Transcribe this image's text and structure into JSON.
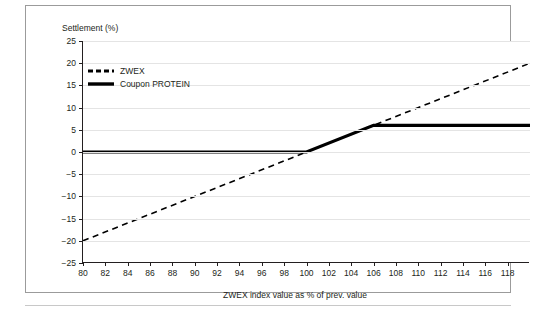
{
  "axis_titles": {
    "y": "Settlement (%)",
    "x": "ZWEX index value as % of prev. value"
  },
  "legend": {
    "items": [
      {
        "label": "ZWEX",
        "style": "dashed",
        "color": "#000000"
      },
      {
        "label": "Coupon PROTEIN",
        "style": "solid",
        "color": "#000000"
      }
    ]
  },
  "chart_data": {
    "type": "line",
    "title": "",
    "subtitle": "",
    "xlabel": "ZWEX index value as % of prev. value",
    "ylabel": "Settlement (%)",
    "xlim": [
      80,
      120
    ],
    "ylim": [
      -25,
      25
    ],
    "xticks": [
      80,
      82,
      84,
      86,
      88,
      90,
      92,
      94,
      96,
      98,
      100,
      102,
      104,
      106,
      108,
      110,
      112,
      114,
      116,
      118
    ],
    "yticks": [
      -25,
      -20,
      -15,
      -10,
      -5,
      0,
      5,
      10,
      15,
      20,
      25
    ],
    "xtick_labels": [
      "80",
      "82",
      "84",
      "86",
      "88",
      "90",
      "92",
      "94",
      "96",
      "98",
      "100",
      "102",
      "104",
      "106",
      "108",
      "110",
      "112",
      "114",
      "116",
      "118"
    ],
    "ytick_labels": [
      "25",
      "20",
      "15",
      "10",
      "5",
      "0",
      "−5",
      "−10",
      "−15",
      "−20",
      "−25"
    ],
    "grid": "horizontal",
    "legend_position": "top-left",
    "series": [
      {
        "name": "ZWEX",
        "style": "dashed",
        "color": "#000000",
        "width": 1.6,
        "x": [
          80,
          120
        ],
        "y": [
          -20,
          20
        ]
      },
      {
        "name": "Coupon PROTEIN",
        "style": "solid",
        "color": "#000000",
        "width": 3.2,
        "x": [
          80,
          100,
          106,
          120
        ],
        "y": [
          0,
          0,
          6,
          6
        ]
      }
    ],
    "annotations": []
  }
}
